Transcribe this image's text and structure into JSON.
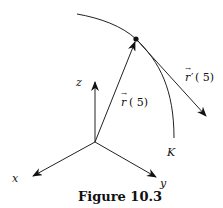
{
  "figure": {
    "caption": "Figure 10.3",
    "axes": {
      "x_label": "x",
      "y_label": "y",
      "z_label": "z"
    },
    "curve_label": "K",
    "position_vector": {
      "arrow": "→",
      "symbol": "r",
      "arg": "( 5)"
    },
    "tangent_vector": {
      "arrow": "→",
      "symbol": "r",
      "prime": "′",
      "arg": "( 5)"
    }
  }
}
